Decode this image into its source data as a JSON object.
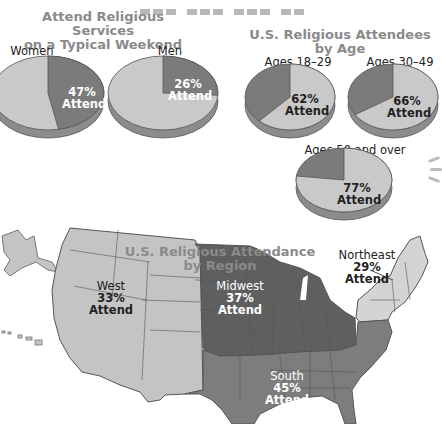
{
  "chart_data": [
    {
      "type": "pie",
      "title": "Attend Religious Services on a Typical Weekend",
      "charts": [
        {
          "label": "Women",
          "attend_percent": 47,
          "annotation": "47% Attend"
        },
        {
          "label": "Men",
          "attend_percent": 26,
          "annotation": "26% Attend"
        }
      ]
    },
    {
      "type": "pie",
      "title": "U.S. Religious Attendees by Age",
      "charts": [
        {
          "label": "Ages 18–29",
          "attend_percent": 62,
          "annotation": "62% Attend"
        },
        {
          "label": "Ages 30–49",
          "attend_percent": 66,
          "annotation": "66% Attend"
        },
        {
          "label": "Ages 50 and over",
          "attend_percent": 77,
          "annotation": "77% Attend"
        }
      ]
    },
    {
      "type": "map",
      "title": "U.S. Religious Attendance by Region",
      "regions": [
        {
          "name": "West",
          "attend_percent": 33,
          "annotation": "33%",
          "sub": "Attend"
        },
        {
          "name": "Midwest",
          "attend_percent": 37,
          "annotation": "37%",
          "sub": "Attend"
        },
        {
          "name": "Northeast",
          "attend_percent": 29,
          "annotation": "29%",
          "sub": "Attend"
        },
        {
          "name": "South",
          "attend_percent": 45,
          "annotation": "45%",
          "sub": "Attend"
        }
      ]
    }
  ],
  "titles": {
    "gender_line1": "Attend Religious Services",
    "gender_line2": "on a Typical Weekend",
    "age": "U.S. Religious Attendees by Age",
    "map_line1": "U.S. Religious Attendance",
    "map_line2": "by Region"
  },
  "colors": {
    "light": "#c9c9c9",
    "dark": "#7b7b7b",
    "darker": "#6e6e6e",
    "west": "#c4c4c4",
    "midwest": "#5f5f5f",
    "south": "#7d7d7d",
    "northeast": "#d4d4d4",
    "title": "#8a8a8a"
  }
}
